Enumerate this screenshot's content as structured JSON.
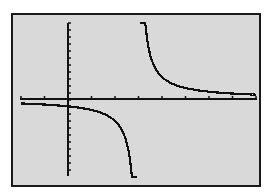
{
  "screen": {
    "background": "#d9d9d9",
    "border_color": "#1a1a1a",
    "plot_color": "#111111"
  },
  "chart_data": {
    "type": "line",
    "title": "",
    "xlabel": "",
    "ylabel": "",
    "function_form": "y = 1/(x - 3) (approximate)",
    "xlim": [
      -2,
      8
    ],
    "ylim": [
      -3.5,
      3.5
    ],
    "grid": false,
    "x_ticks_spacing": 1,
    "y_ticks_spacing": 0.5,
    "vertical_asymptote": 3,
    "horizontal_asymptote": 0,
    "series": [
      {
        "name": "left-branch",
        "x": [
          -2,
          -1,
          0,
          1,
          2,
          2.5,
          2.7,
          2.8
        ],
        "y": [
          -0.2,
          -0.25,
          -0.33,
          -0.5,
          -1,
          -2,
          -3.3,
          -5
        ]
      },
      {
        "name": "right-branch",
        "x": [
          3.2,
          3.3,
          3.5,
          4,
          5,
          6,
          7,
          8
        ],
        "y": [
          5,
          3.3,
          2,
          1,
          0.5,
          0.33,
          0.25,
          0.2
        ]
      }
    ]
  }
}
